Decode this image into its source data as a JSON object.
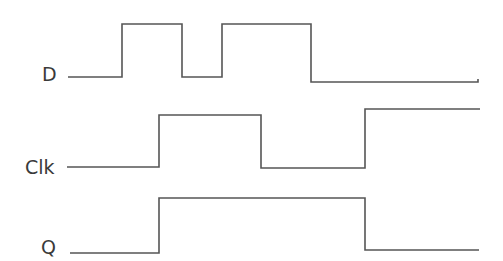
{
  "diagram": {
    "type": "timing-diagram",
    "line_color": "#555555",
    "label_color": "#3a3a3a",
    "signals": [
      {
        "name": "D",
        "label": "D",
        "label_pos": [
          42,
          81
        ],
        "points": "68,77 122,77 122,24 182,24 182,77 222,77 222,24 311,24 311,82 478,82 478,79"
      },
      {
        "name": "Clk",
        "label": "Clk",
        "label_pos": [
          25,
          174
        ],
        "points": "67,167 159,167 159,115 261,115 261,168 365,168 365,109 480,109"
      },
      {
        "name": "Q",
        "label": "Q",
        "label_pos": [
          41,
          254
        ],
        "points": "70,253 159,253 159,198 365,198 365,250 479,250"
      }
    ]
  }
}
